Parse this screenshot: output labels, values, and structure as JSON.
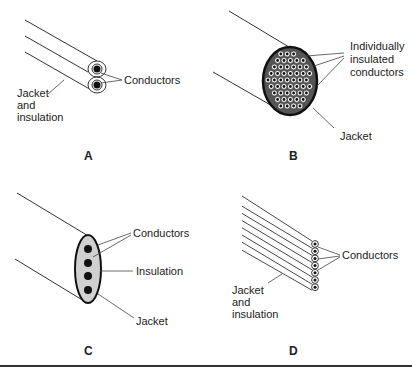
{
  "panels": [
    {
      "id": "A",
      "caption": "A",
      "labels": {
        "conductors": "Conductors",
        "jacket_line1": "Jacket",
        "jacket_line2": "and",
        "jacket_line3": "insulation"
      }
    },
    {
      "id": "B",
      "caption": "B",
      "labels": {
        "conductors_line1": "Individually",
        "conductors_line2": "insulated",
        "conductors_line3": "conductors",
        "jacket": "Jacket"
      }
    },
    {
      "id": "C",
      "caption": "C",
      "labels": {
        "conductors": "Conductors",
        "insulation": "Insulation",
        "jacket": "Jacket"
      }
    },
    {
      "id": "D",
      "caption": "D",
      "labels": {
        "conductors": "Conductors",
        "jacket_line1": "Jacket",
        "jacket_line2": "and",
        "jacket_line3": "insulation"
      }
    }
  ],
  "colors": {
    "line": "#333333",
    "fill_insulation": "#d0d0d0",
    "conductor": "#111111"
  }
}
